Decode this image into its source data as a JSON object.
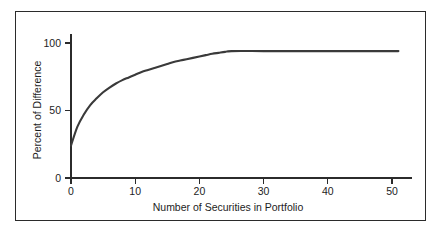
{
  "figure": {
    "frame_color": "#2b2b2b",
    "background_color": "#ffffff",
    "curve_color": "#3a3a3a"
  },
  "chart_data": {
    "type": "line",
    "title": "",
    "subtitle": "",
    "xlabel": "Number of Securities in Portfolio",
    "ylabel": "Percent of Difference",
    "xlim": [
      0,
      51
    ],
    "ylim": [
      0,
      105
    ],
    "xticks": [
      0,
      10,
      20,
      30,
      40,
      50
    ],
    "xticklabels": [
      "0",
      "10",
      "20",
      "30",
      "40",
      "50"
    ],
    "yticks": [
      0,
      50,
      100
    ],
    "yticklabels": [
      "0",
      "50",
      "100"
    ],
    "grid": false,
    "legend": null,
    "legend_position": "none",
    "annotations": [],
    "series": [
      {
        "name": "Percent of Difference",
        "color": "#3a3a3a",
        "x": [
          0,
          1,
          2,
          3,
          4,
          5,
          6,
          7,
          8,
          9,
          10,
          11,
          12,
          13,
          14,
          15,
          16,
          17,
          18,
          19,
          20,
          21,
          22,
          23,
          24,
          25,
          30,
          35,
          40,
          45,
          51
        ],
        "values": [
          24,
          38,
          47,
          54,
          59,
          63.5,
          67,
          70,
          72.5,
          74.5,
          76.5,
          78.5,
          80,
          81.5,
          83,
          84.5,
          86,
          87,
          88,
          89,
          90,
          91,
          92,
          92.7,
          93.4,
          94,
          94,
          94,
          94,
          94,
          94
        ]
      }
    ]
  }
}
